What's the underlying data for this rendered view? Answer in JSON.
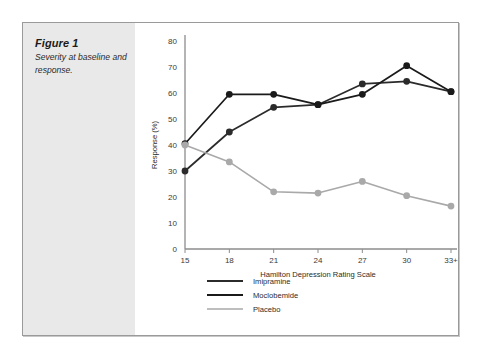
{
  "caption": {
    "title": "Figure 1",
    "text": "Severity at baseline and response."
  },
  "colors": {
    "imipramine": "#2b2b2b",
    "moclobemide": "#1a1a1a",
    "placebo": "#a9a9a9",
    "axis": "#8c8c8c",
    "panel_background": "#e9e9e9",
    "border": "#9a9a9a"
  },
  "legend": {
    "position": "below-axis-left",
    "items": [
      {
        "label": "Imipramine",
        "color": "#2b2b2b"
      },
      {
        "label": "Moclobemide",
        "color": "#1a1a1a"
      },
      {
        "label": "Placebo",
        "color": "#a9a9a9"
      }
    ]
  },
  "chart_data": {
    "type": "line",
    "title": "",
    "xlabel": "Hamilton Depression Rating Scale",
    "ylabel": "Response (%)",
    "categories": [
      "15",
      "18",
      "21",
      "24",
      "27",
      "30",
      "33+"
    ],
    "x_tick_labels": [
      "15",
      "18",
      "21",
      "24",
      "27",
      "30",
      "33+"
    ],
    "y_tick_labels": [
      "0",
      "10",
      "20",
      "30",
      "40",
      "50",
      "60",
      "70",
      "80"
    ],
    "ylim": [
      0,
      80
    ],
    "ytick_step": 10,
    "grid": false,
    "markers": true,
    "series": [
      {
        "name": "Imipramine",
        "color": "#2b2b2b",
        "values": [
          30,
          45,
          54.5,
          55.5,
          63.5,
          64.5,
          60.5
        ]
      },
      {
        "name": "Moclobemide",
        "color": "#1a1a1a",
        "values": [
          40.5,
          59.5,
          59.5,
          55.5,
          59.5,
          70.5,
          60.5
        ]
      },
      {
        "name": "Placebo",
        "color": "#a9a9a9",
        "values": [
          40,
          33.5,
          22,
          21.5,
          26,
          20.5,
          16.5
        ]
      }
    ]
  }
}
